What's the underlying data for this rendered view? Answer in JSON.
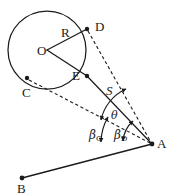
{
  "figure": {
    "type": "geometry-diagram",
    "caption": "",
    "background_color": "#ffffff",
    "stroke_color": "#1b1b1b",
    "label_color": "#1b1b1b"
  },
  "points": {
    "O": {
      "label": "O",
      "x": 47,
      "y": 50,
      "label_x": 37,
      "label_y": 44,
      "marker": false
    },
    "D": {
      "label": "D",
      "x": 87,
      "y": 29,
      "label_x": 95,
      "label_y": 20,
      "marker": true
    },
    "E": {
      "label": "E",
      "x": 87,
      "y": 76,
      "label_x": 72,
      "label_y": 69,
      "marker": true
    },
    "C": {
      "label": "C",
      "x": 27,
      "y": 78,
      "label_x": 22,
      "label_y": 86,
      "marker": true
    },
    "A": {
      "label": "A",
      "x": 152,
      "y": 144,
      "label_x": 157,
      "label_y": 137,
      "marker": true
    },
    "B": {
      "label": "B",
      "x": 22,
      "y": 178,
      "label_x": 17,
      "label_y": 182,
      "marker": true
    }
  },
  "segments": {
    "radius_OD": {
      "name": "R",
      "label": "R",
      "style": "solid",
      "label_x": 61,
      "label_y": 26
    },
    "radius_OE": {
      "name": "OE",
      "label": "",
      "style": "solid"
    },
    "distance_EA": {
      "name": "S",
      "label": "S",
      "style": "solid",
      "label_x": 106,
      "label_y": 84
    },
    "baseline_AB": {
      "name": "AB",
      "label": "",
      "style": "solid"
    },
    "sightline_DA": {
      "name": "DA",
      "label": "",
      "style": "dashed"
    },
    "sightline_CA": {
      "name": "CA",
      "label": "",
      "style": "dashed"
    }
  },
  "angles": {
    "theta": {
      "label": "θ",
      "label_x": 111,
      "label_y": 110,
      "arrows": "both"
    },
    "beta_c": {
      "label": "β",
      "subscript": "C",
      "label_x": 89,
      "label_y": 129,
      "arrows": "both"
    },
    "beta_d": {
      "label": "β",
      "subscript": "D",
      "label_x": 114,
      "label_y": 129,
      "arrows": "both"
    }
  },
  "circle": {
    "center_x": 47,
    "center_y": 50,
    "radius": 39
  }
}
